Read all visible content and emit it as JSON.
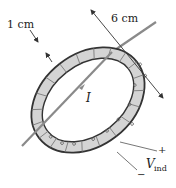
{
  "diagram": {
    "labels": {
      "thickness": "1 cm",
      "diameter": "6 cm",
      "current": "I",
      "plus": "+",
      "minus": "−",
      "voltage_main": "V",
      "voltage_sub": "ind"
    },
    "colors": {
      "toroid_fill": "#d4d4d4",
      "toroid_edge": "#333333",
      "wire": "#8a8a8a",
      "dimension_line": "#333333",
      "text": "#222222"
    }
  }
}
